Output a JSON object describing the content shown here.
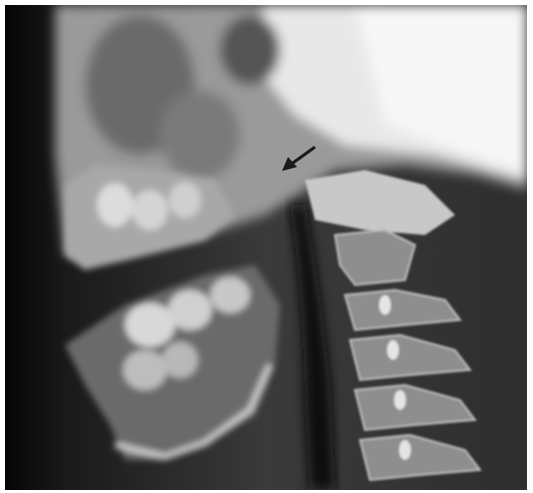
{
  "image": {
    "subject": "lateral radiograph of skull base and cervical spine",
    "annotation": "arrow-pointer",
    "arrow_color": "#1a1a1a"
  }
}
